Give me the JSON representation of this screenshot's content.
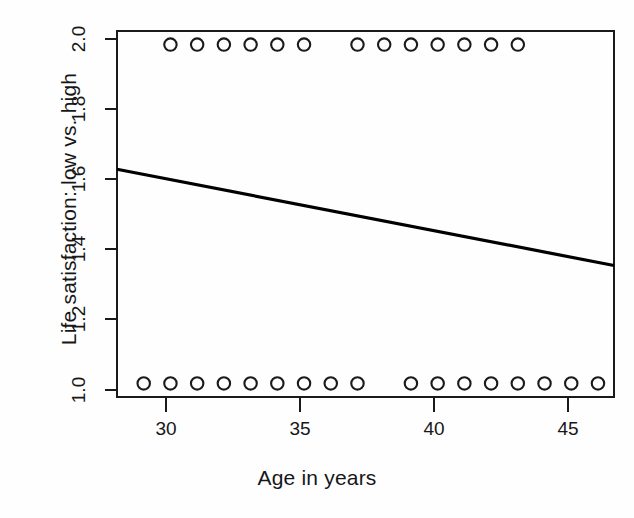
{
  "chart_data": {
    "type": "scatter",
    "title": "",
    "xlabel": "Age in years",
    "ylabel": "Life satisfaction: low vs. high",
    "xlim": [
      28.0,
      46.6
    ],
    "ylim": [
      0.96,
      2.04
    ],
    "xticks": [
      30,
      35,
      40,
      45
    ],
    "xtick_labels": [
      "30",
      "35",
      "40",
      "45"
    ],
    "yticks": [
      1.0,
      1.2,
      1.4,
      1.6,
      1.8,
      2.0
    ],
    "ytick_labels": [
      "1.0",
      "1.2",
      "1.4",
      "1.6",
      "1.8",
      "2.0"
    ],
    "grid": false,
    "legend": "none",
    "marker": "open-circle",
    "points": [
      {
        "x": 30,
        "y": 2.0
      },
      {
        "x": 31,
        "y": 2.0
      },
      {
        "x": 32,
        "y": 2.0
      },
      {
        "x": 33,
        "y": 2.0
      },
      {
        "x": 34,
        "y": 2.0
      },
      {
        "x": 35,
        "y": 2.0
      },
      {
        "x": 37,
        "y": 2.0
      },
      {
        "x": 38,
        "y": 2.0
      },
      {
        "x": 39,
        "y": 2.0
      },
      {
        "x": 40,
        "y": 2.0
      },
      {
        "x": 41,
        "y": 2.0
      },
      {
        "x": 42,
        "y": 2.0
      },
      {
        "x": 43,
        "y": 2.0
      },
      {
        "x": 29,
        "y": 1.0
      },
      {
        "x": 30,
        "y": 1.0
      },
      {
        "x": 31,
        "y": 1.0
      },
      {
        "x": 32,
        "y": 1.0
      },
      {
        "x": 33,
        "y": 1.0
      },
      {
        "x": 34,
        "y": 1.0
      },
      {
        "x": 35,
        "y": 1.0
      },
      {
        "x": 36,
        "y": 1.0
      },
      {
        "x": 37,
        "y": 1.0
      },
      {
        "x": 39,
        "y": 1.0
      },
      {
        "x": 40,
        "y": 1.0
      },
      {
        "x": 41,
        "y": 1.0
      },
      {
        "x": 42,
        "y": 1.0
      },
      {
        "x": 43,
        "y": 1.0
      },
      {
        "x": 44,
        "y": 1.0
      },
      {
        "x": 45,
        "y": 1.0
      },
      {
        "x": 46,
        "y": 1.0
      }
    ],
    "series": [
      {
        "name": "observations (top row, y = 2.0)",
        "x": [
          30,
          31,
          32,
          33,
          34,
          35,
          37,
          38,
          39,
          40,
          41,
          42,
          43
        ],
        "values": [
          2.0,
          2.0,
          2.0,
          2.0,
          2.0,
          2.0,
          2.0,
          2.0,
          2.0,
          2.0,
          2.0,
          2.0,
          2.0
        ]
      },
      {
        "name": "observations (bottom row, y = 1.0)",
        "x": [
          29,
          30,
          31,
          32,
          33,
          34,
          35,
          36,
          37,
          39,
          40,
          41,
          42,
          43,
          44,
          45,
          46
        ],
        "values": [
          1.0,
          1.0,
          1.0,
          1.0,
          1.0,
          1.0,
          1.0,
          1.0,
          1.0,
          1.0,
          1.0,
          1.0,
          1.0,
          1.0,
          1.0,
          1.0,
          1.0
        ]
      }
    ],
    "regression_line": {
      "name": "fitted regression line",
      "x_start": 28.0,
      "y_start": 1.632,
      "x_end": 46.6,
      "y_end": 1.348,
      "slope": -0.01527,
      "intercept": 2.0596,
      "color": "#000000",
      "line_width": 3
    },
    "colors": {
      "marker_stroke": "#1a1a1a",
      "axis": "#1a1a1a",
      "line": "#000000",
      "background": "#fefefe"
    }
  }
}
